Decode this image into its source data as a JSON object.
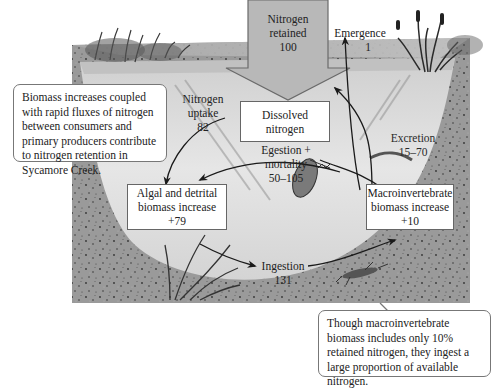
{
  "diagram": {
    "title": "Nitrogen retention in Sycamore Creek",
    "top_arrow": {
      "line1": "Nitrogen",
      "line2": "retained",
      "value": "100"
    },
    "emergence": {
      "label": "Emergence",
      "value": "1"
    },
    "nitrogen_uptake": {
      "line1": "Nitrogen",
      "line2": "uptake",
      "value": "82"
    },
    "dissolved_nitrogen": {
      "line1": "Dissolved",
      "line2": "nitrogen"
    },
    "egestion": {
      "line1": "Egestion +",
      "line2": "mortality",
      "value": "50–105"
    },
    "excretion": {
      "label": "Excretion",
      "value": "15–70"
    },
    "algal_box": {
      "line1": "Algal and detrital",
      "line2": "biomass increase",
      "value": "+79"
    },
    "macro_box": {
      "line1": "Macroinvertebrate",
      "line2": "biomass increase",
      "value": "+10"
    },
    "ingestion": {
      "label": "Ingestion",
      "value": "131"
    },
    "callout_left": "Biomass increases coupled with rapid fluxes of nitrogen between consumers and primary producers contribute to nitrogen retention in Sycamore Creek.",
    "callout_right": "Though macroinvertebrate biomass includes only 10% retained nitrogen, they ingest a large proportion of available nitrogen.",
    "colors": {
      "arrow_fill": "#b8b8b8",
      "arrow_stroke": "#6a6a6a",
      "water": "#dcdcdc",
      "sediment": "#8c8c8c",
      "flow_arrow": "#1a1a1a"
    }
  }
}
